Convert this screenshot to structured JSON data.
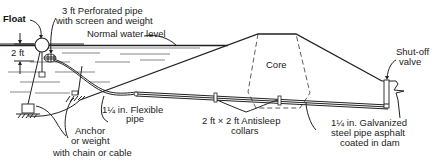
{
  "diagram": {
    "type": "pond-drain-siphon-cross-section",
    "labels": {
      "float": "Float",
      "perforated_pipe_line1": "3 ft Perforated pipe",
      "perforated_pipe_line2": "with screen and weight",
      "water_level": "Normal water level",
      "depth": "2 ft",
      "core": "Core",
      "shutoff_line1": "Shut-off",
      "shutoff_line2": "valve",
      "flex_pipe_line1": "1¼ in. Flexible",
      "flex_pipe_line2": "pipe",
      "anchor_line1": "Anchor",
      "anchor_line2": "or weight",
      "anchor_line3": "with chain or cable",
      "collars_line1": "2 ft × 2 ft Antisleep",
      "collars_line2": "collars",
      "steel_pipe_line1": "1¼ in. Galvanized",
      "steel_pipe_line2": "steel pipe asphalt",
      "steel_pipe_line3": "coated in dam"
    },
    "components": [
      {
        "name": "float"
      },
      {
        "name": "perforated-pipe"
      },
      {
        "name": "flexible-pipe"
      },
      {
        "name": "anchor-weights"
      },
      {
        "name": "dam-embankment"
      },
      {
        "name": "core"
      },
      {
        "name": "antiseep-collars",
        "count": 2
      },
      {
        "name": "galvanized-steel-pipe"
      },
      {
        "name": "shut-off-valve"
      }
    ],
    "colors": {
      "line": "#222222",
      "background": "#ffffff"
    }
  }
}
